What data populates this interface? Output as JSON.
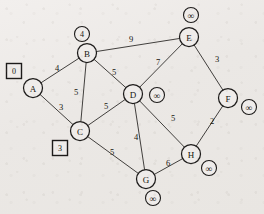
{
  "figure": {
    "kind": "weighted-undirected-graph",
    "width": 264,
    "height": 214,
    "background_color": "#efecea",
    "ink_color": "#1d1b1a"
  },
  "nodes": [
    {
      "id": "A",
      "label": "A",
      "x": 33,
      "y": 88,
      "r": 9.5
    },
    {
      "id": "B",
      "label": "B",
      "x": 87,
      "y": 53,
      "r": 9.5
    },
    {
      "id": "C",
      "label": "C",
      "x": 80,
      "y": 131,
      "r": 9.5
    },
    {
      "id": "D",
      "label": "D",
      "x": 133,
      "y": 94,
      "r": 9.5
    },
    {
      "id": "E",
      "label": "E",
      "x": 189,
      "y": 37,
      "r": 9.5
    },
    {
      "id": "F",
      "label": "F",
      "x": 228,
      "y": 98,
      "r": 9.5
    },
    {
      "id": "G",
      "label": "G",
      "x": 146,
      "y": 179,
      "r": 9.5
    },
    {
      "id": "H",
      "label": "H",
      "x": 191,
      "y": 154,
      "r": 9.5
    }
  ],
  "edges": [
    {
      "from": "A",
      "to": "B",
      "weight": "4",
      "lx": 57,
      "ly": 68
    },
    {
      "from": "A",
      "to": "C",
      "weight": "3",
      "lx": 61,
      "ly": 107
    },
    {
      "from": "B",
      "to": "C",
      "weight": "5",
      "lx": 76,
      "ly": 92
    },
    {
      "from": "B",
      "to": "D",
      "weight": "5",
      "lx": 114,
      "ly": 72
    },
    {
      "from": "B",
      "to": "E",
      "weight": "9",
      "lx": 131,
      "ly": 39
    },
    {
      "from": "C",
      "to": "D",
      "weight": "5",
      "lx": 106,
      "ly": 106
    },
    {
      "from": "C",
      "to": "G",
      "weight": "5",
      "lx": 112,
      "ly": 152
    },
    {
      "from": "D",
      "to": "E",
      "weight": "7",
      "lx": 158,
      "ly": 62
    },
    {
      "from": "D",
      "to": "G",
      "weight": "4",
      "lx": 136,
      "ly": 137
    },
    {
      "from": "D",
      "to": "H",
      "weight": "5",
      "lx": 173,
      "ly": 118
    },
    {
      "from": "E",
      "to": "F",
      "weight": "3",
      "lx": 217,
      "ly": 59
    },
    {
      "from": "F",
      "to": "H",
      "weight": "2",
      "lx": 212,
      "ly": 121
    },
    {
      "from": "G",
      "to": "H",
      "weight": "6",
      "lx": 168,
      "ly": 163
    }
  ],
  "distance_labels": [
    {
      "node": "A",
      "value": "0",
      "shape": "box",
      "x": 14,
      "y": 71
    },
    {
      "node": "B",
      "value": "4",
      "shape": "circle",
      "x": 82,
      "y": 34
    },
    {
      "node": "C",
      "value": "3",
      "shape": "box",
      "x": 60,
      "y": 148
    },
    {
      "node": "D",
      "value": "∞",
      "shape": "circle",
      "x": 157,
      "y": 95
    },
    {
      "node": "E",
      "value": "∞",
      "shape": "circle",
      "x": 191,
      "y": 15
    },
    {
      "node": "F",
      "value": "∞",
      "shape": "circle",
      "x": 249,
      "y": 107
    },
    {
      "node": "G",
      "value": "∞",
      "shape": "circle",
      "x": 153,
      "y": 198
    },
    {
      "node": "H",
      "value": "∞",
      "shape": "circle",
      "x": 209,
      "y": 168
    }
  ]
}
